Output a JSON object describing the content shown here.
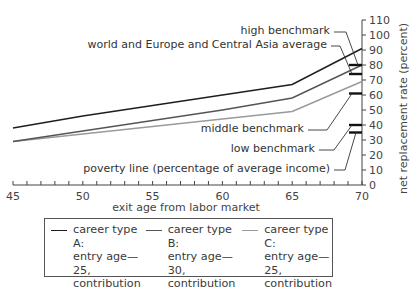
{
  "chart_data": {
    "type": "line",
    "title": "",
    "xlabel": "exit age from labor market",
    "ylabel": "net replacement rate (percent)",
    "xlim": [
      45,
      70
    ],
    "ylim": [
      0,
      110
    ],
    "x_ticks": [
      45,
      50,
      55,
      60,
      65,
      70
    ],
    "y_ticks": [
      0,
      10,
      20,
      30,
      40,
      50,
      60,
      70,
      80,
      90,
      100,
      110
    ],
    "y_axis_position": "right",
    "grid": false,
    "x": [
      45,
      50,
      55,
      60,
      65,
      70
    ],
    "series": [
      {
        "name": "career type A: entry age—25, contribution density—100%",
        "color": "#1e1e1e",
        "values": [
          38,
          46,
          53,
          60,
          67,
          91
        ]
      },
      {
        "name": "career type B: entry age—30, contribution density—100%",
        "color": "#555555",
        "values": [
          29,
          36,
          43,
          50,
          58,
          80
        ]
      },
      {
        "name": "career type C: entry age—25, contribution density—75%",
        "color": "#9a9a9a",
        "values": [
          29,
          34,
          39,
          44,
          49,
          69
        ]
      }
    ],
    "benchmarks": [
      {
        "label": "high benchmark",
        "value": 80
      },
      {
        "label": "world and Europe and Central Asia average",
        "value": 74
      },
      {
        "label": "middle benchmark",
        "value": 61
      },
      {
        "label": "low benchmark",
        "value": 40
      },
      {
        "label": "poverty line (percentage of average income)",
        "value": 35
      }
    ],
    "legend_position": "bottom"
  },
  "legend": {
    "items": [
      {
        "label": "career type  A:\nentry age—25,\ncontribution\ndensity—100%",
        "color": "#1e1e1e"
      },
      {
        "label": "career type  B:\nentry age—30,\ncontribution\ndensity—100%",
        "color": "#555555"
      },
      {
        "label": "career type  C:\nentry age—25,\ncontribution\ndensity—75%",
        "color": "#9a9a9a"
      }
    ]
  }
}
